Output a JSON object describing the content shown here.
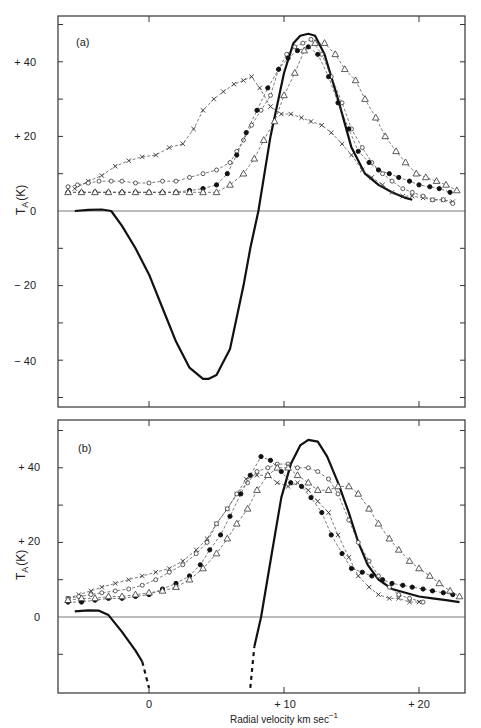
{
  "chart_data": [
    {
      "panel": "(a)",
      "type": "line",
      "title": "(a)",
      "xlabel": "",
      "ylabel": "T_A (K)",
      "xlim": [
        -6.7,
        23.4
      ],
      "ylim": [
        -52,
        52
      ],
      "yticks": [
        -40,
        -20,
        0,
        20,
        40
      ],
      "ytick_labels": [
        "− 40",
        "− 20",
        "0",
        "+ 20",
        "+ 40"
      ],
      "grid": false,
      "series": [
        {
          "name": "solid",
          "style": "solid-thick",
          "x": [
            -5.5,
            -4.5,
            -3.5,
            -2.8,
            -2,
            -1,
            0,
            1,
            2,
            3,
            4,
            4.4,
            5,
            6,
            7,
            7.5,
            8.1,
            9,
            10,
            10.7,
            11.2,
            11.8,
            12.3,
            13,
            14,
            15,
            16,
            17,
            18,
            19,
            19.5
          ],
          "y": [
            0,
            0.3,
            0.4,
            0,
            -4,
            -10,
            -17,
            -26,
            -35,
            -42,
            -45,
            -45,
            -44,
            -37,
            -20,
            -10,
            0,
            20,
            37,
            45,
            47,
            47.5,
            47,
            42,
            30,
            17,
            10,
            7,
            5,
            3.5,
            3
          ]
        },
        {
          "name": "cross",
          "marker": "x",
          "x": [
            -5.5,
            -4.5,
            -3.5,
            -2.5,
            -1.5,
            -0.5,
            0.5,
            1.5,
            2.5,
            3.3,
            4,
            4.8,
            5.5,
            6.3,
            7,
            7.6,
            8.2,
            9,
            9.8,
            10.5,
            11.3,
            12,
            12.8,
            13.5,
            14.3,
            15,
            15.8,
            16.5,
            17.3,
            18,
            18.8,
            19.5,
            20.3,
            21,
            21.8,
            22.5
          ],
          "y": [
            6,
            8,
            9.5,
            12,
            13.5,
            14.5,
            15,
            17,
            18,
            22,
            27,
            30,
            32,
            34,
            35,
            36,
            33,
            28,
            26,
            26,
            25,
            24,
            23,
            21,
            18,
            15,
            11,
            9,
            7,
            5,
            4,
            4,
            3.5,
            3,
            3,
            2.5
          ]
        },
        {
          "name": "open-circle",
          "marker": "o",
          "x": [
            -6,
            -5.3,
            -4.5,
            -3.7,
            -2.8,
            -2,
            -1,
            0,
            1,
            2,
            3,
            4,
            5,
            6,
            6.5,
            7,
            7.6,
            8.3,
            9,
            9.6,
            10.2,
            10.8,
            11.4,
            12,
            12.8,
            13.5,
            14.3,
            15,
            15.8,
            16.5,
            17.3,
            18,
            18.8,
            19.5,
            20.3,
            21,
            21.8,
            22.5
          ],
          "y": [
            6.5,
            7,
            7.5,
            8,
            8,
            8,
            7.5,
            7.5,
            8,
            8,
            9,
            10,
            11,
            13,
            16,
            19,
            23,
            27,
            31,
            38,
            42,
            44,
            45,
            46,
            42,
            36,
            29,
            22,
            17,
            13,
            10,
            8,
            6,
            5,
            4,
            3,
            3,
            2
          ]
        },
        {
          "name": "filled-circle",
          "marker": "filled",
          "x": [
            -6,
            -5,
            -4,
            -3,
            -2,
            -1,
            0,
            1,
            2,
            3,
            4,
            5,
            5.8,
            6.5,
            7.2,
            8,
            8.8,
            9.6,
            10.3,
            11,
            11.8,
            12.5,
            13.3,
            14,
            14.8,
            15.5,
            16.3,
            17,
            17.8,
            18.5,
            19.3,
            20,
            20.8,
            21.5,
            22.3
          ],
          "y": [
            5,
            5,
            5,
            5,
            5,
            5,
            5,
            5,
            5,
            5.5,
            6,
            7,
            10,
            15,
            21,
            27,
            33,
            38,
            41,
            43,
            44,
            42,
            36,
            29,
            22,
            16,
            13,
            11,
            10,
            9,
            8,
            7,
            6.5,
            6,
            5
          ]
        },
        {
          "name": "open-triangle",
          "marker": "triangle",
          "x": [
            -6,
            -5,
            -4,
            -3,
            -2,
            -1,
            0,
            1,
            2,
            3,
            4,
            5,
            6,
            7,
            7.8,
            8.5,
            9.3,
            10,
            10.8,
            11.5,
            12.3,
            13,
            13.8,
            14.5,
            15.3,
            16,
            16.8,
            17.5,
            18.3,
            19,
            19.8,
            20.5,
            21.3,
            22,
            22.8
          ],
          "y": [
            5,
            5,
            5,
            5,
            5,
            5,
            5,
            5,
            5,
            5,
            5,
            5,
            7,
            10,
            14,
            19,
            24,
            31,
            37,
            43,
            45,
            45,
            42,
            38,
            35,
            30,
            25,
            20,
            16,
            13,
            10,
            9,
            8,
            7,
            5.5
          ]
        }
      ]
    },
    {
      "panel": "(b)",
      "type": "line",
      "title": "(b)",
      "xlabel": "Radial velocity km sec⁻¹",
      "ylabel": "T_A (K)",
      "xlim": [
        -6.7,
        23.4
      ],
      "ylim": [
        -20,
        52
      ],
      "xticks": [
        0,
        10,
        20
      ],
      "xtick_labels": [
        "0",
        "+ 10",
        "+ 20"
      ],
      "yticks": [
        0,
        20,
        40
      ],
      "ytick_labels": [
        "0",
        "+ 20",
        "+ 40"
      ],
      "grid": false,
      "series": [
        {
          "name": "solid",
          "style": "solid-thick",
          "x": [
            -5.5,
            -4.5,
            -3.7,
            -3,
            -2,
            -1,
            -0.5
          ],
          "y": [
            1.5,
            1.8,
            1.7,
            0.5,
            -4,
            -9,
            -12
          ],
          "dashed_extension": {
            "x": [
              -0.5,
              0
            ],
            "y": [
              -12,
              -19
            ]
          }
        },
        {
          "name": "solid-rise",
          "style": "solid-thick",
          "x": [
            7.8,
            8.3,
            9,
            9.8,
            10.5,
            11.2,
            11.8,
            12.5,
            13.2,
            14,
            14.8,
            15.5,
            16.2,
            17,
            18,
            19,
            20,
            21,
            22,
            23
          ],
          "y": [
            -8,
            0,
            15,
            32,
            41,
            46,
            47.5,
            47,
            43,
            36,
            28,
            20,
            14,
            10,
            7.5,
            6.5,
            5.5,
            5,
            4.5,
            4
          ],
          "dashed_extension": {
            "x": [
              7.5,
              7.8
            ],
            "y": [
              -19,
              -8
            ]
          }
        },
        {
          "name": "cross",
          "marker": "x",
          "x": [
            -6,
            -5.2,
            -4.3,
            -3.5,
            -2.5,
            -1.5,
            -0.5,
            0.5,
            1.5,
            2.5,
            3.5,
            4.3,
            5,
            5.8,
            6.5,
            7.2,
            8,
            8.8,
            9.5,
            10.3,
            11,
            11.8,
            12.5,
            13.3,
            14,
            14.8,
            15.5,
            16.3,
            17,
            17.8,
            18.5,
            19.3,
            20
          ],
          "y": [
            5,
            6,
            7,
            8,
            9,
            10,
            11,
            12,
            13,
            15,
            18,
            21,
            25,
            29,
            33,
            37,
            38,
            38,
            36,
            35,
            36,
            34,
            31,
            28,
            22,
            16,
            11,
            8,
            6,
            5,
            5,
            4,
            4
          ]
        },
        {
          "name": "open-circle",
          "marker": "o",
          "x": [
            -6,
            -5.2,
            -4.3,
            -3.5,
            -2.5,
            -1.5,
            -0.5,
            0.5,
            1.5,
            2.5,
            3.5,
            4.3,
            5,
            5.8,
            6.5,
            7.3,
            8,
            8.8,
            9.5,
            10.3,
            11,
            11.8,
            12.5,
            13.3,
            14,
            14.8,
            15.5,
            16.3,
            17,
            17.8,
            18.5,
            19.3,
            20.3
          ],
          "y": [
            5,
            5.5,
            6,
            6.5,
            7,
            7.5,
            8.5,
            10,
            12,
            14,
            17,
            20,
            25,
            29,
            33,
            36,
            39,
            40,
            41,
            41,
            40,
            40,
            39,
            37,
            33,
            26,
            20,
            15,
            11,
            8,
            6,
            5,
            4
          ]
        },
        {
          "name": "filled-circle",
          "marker": "filled",
          "x": [
            -6,
            -5,
            -4,
            -3,
            -2,
            -1,
            0,
            1,
            2,
            3,
            3.8,
            4.5,
            5.3,
            6,
            6.8,
            7.5,
            8.3,
            9,
            9.8,
            10.5,
            11.3,
            12,
            12.8,
            13.5,
            14.3,
            15,
            15.8,
            16.5,
            17.3,
            18,
            18.8,
            19.5,
            20.3,
            21,
            21.8,
            22.5
          ],
          "y": [
            4,
            4,
            4.5,
            5,
            5,
            5.5,
            6,
            7.5,
            9,
            11,
            14,
            18,
            22,
            27,
            33,
            38,
            43,
            42,
            39,
            36,
            35,
            32,
            28,
            22,
            17,
            13,
            12,
            11,
            10,
            9,
            8.5,
            8,
            7.5,
            7,
            6.5,
            6
          ]
        },
        {
          "name": "open-triangle",
          "marker": "triangle",
          "x": [
            -6,
            -5,
            -4,
            -3,
            -2,
            -1,
            0,
            1,
            2,
            3,
            4,
            5,
            5.8,
            6.5,
            7.3,
            8,
            8.8,
            9.5,
            10.3,
            11,
            11.8,
            12.5,
            13.3,
            14,
            14.8,
            15.5,
            16.3,
            17,
            17.8,
            18.5,
            19.3,
            20,
            20.8,
            21.5,
            22.3,
            23
          ],
          "y": [
            4.5,
            5,
            5,
            5.5,
            5.5,
            6,
            6.5,
            7,
            8,
            10,
            13,
            17,
            21,
            25,
            29,
            34,
            38,
            40,
            40,
            38,
            36,
            34,
            34,
            35,
            35,
            33,
            29,
            25,
            21,
            18,
            15,
            13,
            11,
            9,
            7,
            5.5
          ]
        }
      ]
    }
  ],
  "labels": {
    "panel_a": "(a)",
    "panel_b": "(b)",
    "ylabel_main": "T",
    "ylabel_sub": "A",
    "ylabel_unit": "(K)",
    "xlabel_main": "Radial velocity km sec",
    "xlabel_sup": "−1",
    "a_yticks": [
      "+ 40",
      "+ 20",
      "0",
      "− 20",
      "− 40"
    ],
    "b_yticks": [
      "+ 40",
      "+ 20",
      "0"
    ],
    "b_xticks": [
      "0",
      "+ 10",
      "+ 20"
    ]
  }
}
